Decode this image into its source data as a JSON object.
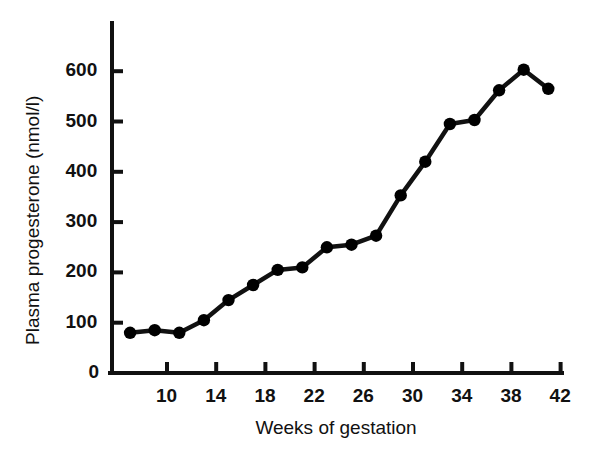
{
  "chart_data": {
    "type": "line",
    "title": "",
    "xlabel": "Weeks of gestation",
    "ylabel": "Plasma progesterone (nmol/l)",
    "xlim": [
      6,
      43
    ],
    "ylim": [
      0,
      690
    ],
    "grid": false,
    "legend": "none",
    "marker": "filled-circle",
    "line_color": "#000000",
    "marker_color": "#000000",
    "xticks": [
      10,
      14,
      18,
      22,
      26,
      30,
      34,
      38,
      42
    ],
    "yticks": [
      0,
      100,
      200,
      300,
      400,
      500,
      600
    ],
    "x": [
      7,
      9,
      11,
      13,
      15,
      17,
      19,
      21,
      23,
      25,
      27,
      29,
      31,
      33,
      35,
      37,
      39,
      41
    ],
    "values": [
      80,
      85,
      80,
      105,
      145,
      175,
      205,
      210,
      250,
      255,
      273,
      353,
      420,
      495,
      503,
      562,
      603,
      565
    ],
    "points": [
      {
        "week": 7,
        "value": 80
      },
      {
        "week": 9,
        "value": 85
      },
      {
        "week": 11,
        "value": 80
      },
      {
        "week": 13,
        "value": 105
      },
      {
        "week": 15,
        "value": 145
      },
      {
        "week": 17,
        "value": 175
      },
      {
        "week": 19,
        "value": 205
      },
      {
        "week": 21,
        "value": 210
      },
      {
        "week": 23,
        "value": 250
      },
      {
        "week": 25,
        "value": 255
      },
      {
        "week": 27,
        "value": 273
      },
      {
        "week": 29,
        "value": 353
      },
      {
        "week": 31,
        "value": 420
      },
      {
        "week": 33,
        "value": 495
      },
      {
        "week": 35,
        "value": 503
      },
      {
        "week": 37,
        "value": 562
      },
      {
        "week": 39,
        "value": 603
      },
      {
        "week": 41,
        "value": 565
      }
    ]
  },
  "axes": {
    "y_tick_labels": [
      "600",
      "500",
      "400",
      "300",
      "200",
      "100",
      "0"
    ],
    "x_tick_labels": [
      "10",
      "14",
      "18",
      "22",
      "26",
      "30",
      "34",
      "38",
      "42"
    ],
    "y_axis_title": "Plasma progesterone (nmol/l)",
    "x_axis_title": "Weeks of gestation"
  },
  "colors": {
    "ink": "#111111",
    "background": "#ffffff"
  }
}
